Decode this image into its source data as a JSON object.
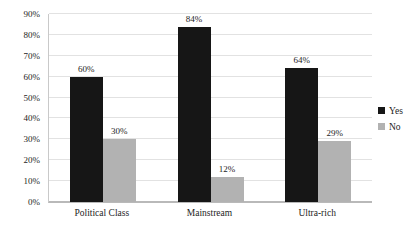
{
  "chart_data": {
    "type": "bar",
    "title": "",
    "subtitle": "",
    "xlabel": "",
    "ylabel": "",
    "categories": [
      "Political Class",
      "Mainstream",
      "Ultra-rich"
    ],
    "series": [
      {
        "name": "Yes",
        "color": "#161616",
        "values": [
          60,
          84,
          64
        ],
        "labels": [
          "60%",
          "84%",
          "64%"
        ]
      },
      {
        "name": "No",
        "color": "#b2b2b2",
        "values": [
          30,
          12,
          29
        ],
        "labels": [
          "30%",
          "12%",
          "29%"
        ]
      }
    ],
    "ylim": [
      0,
      90
    ],
    "ytick_values": [
      0,
      10,
      20,
      30,
      40,
      50,
      60,
      70,
      80,
      90
    ],
    "ytick_labels": [
      "0%",
      "10%",
      "20%",
      "30%",
      "40%",
      "50%",
      "60%",
      "70%",
      "80%",
      "90%"
    ],
    "grid": true,
    "grid_orientation": "horizontal",
    "legend_position": "right",
    "value_labels_shown": true,
    "background_color": "#ffffff",
    "gridline_color": "#e2e2e2",
    "axis_color": "#b9b9b9"
  }
}
